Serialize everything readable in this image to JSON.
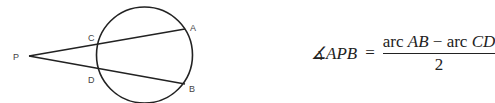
{
  "diagram": {
    "labels": {
      "P": "P",
      "A": "A",
      "B": "B",
      "C": "C",
      "D": "D"
    },
    "circle": {
      "cx": 144.5,
      "cy": 55,
      "r": 48
    },
    "points": {
      "P": [
        29,
        56
      ],
      "A": [
        185,
        29
      ],
      "B": [
        185,
        84
      ],
      "C": [
        98,
        43
      ],
      "D": [
        98,
        69
      ]
    },
    "stroke_color": "#222222"
  },
  "formula": {
    "angle_symbol": "∡",
    "lhs": "APB",
    "equals": "=",
    "numerator": {
      "arc1_word": "arc ",
      "arc1": "AB",
      "minus": " − ",
      "arc2_word": "arc ",
      "arc2": "CD"
    },
    "denominator": "2"
  }
}
